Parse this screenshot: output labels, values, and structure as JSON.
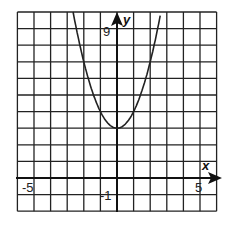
{
  "chart_data": {
    "type": "line",
    "title": "",
    "function": "y = x^2 + 3",
    "xlabel": "x",
    "ylabel": "y",
    "xlim": [
      -6,
      6
    ],
    "ylim": [
      -2,
      10
    ],
    "grid": true,
    "grid_step": 1,
    "tick_labels": {
      "x": [
        "-5",
        "5"
      ],
      "y": [
        "9",
        "-1"
      ]
    },
    "series": [
      {
        "name": "parabola",
        "x": [
          -2.65,
          -2,
          -1,
          0,
          1,
          2,
          2.65
        ],
        "y": [
          10,
          7,
          4,
          3,
          4,
          7,
          10
        ]
      }
    ],
    "vertex": [
      0,
      3
    ]
  },
  "labels": {
    "x_axis": "x",
    "y_axis": "y",
    "x_neg": "-5",
    "x_pos": "5",
    "y_top": "9",
    "y_neg": "-1"
  }
}
